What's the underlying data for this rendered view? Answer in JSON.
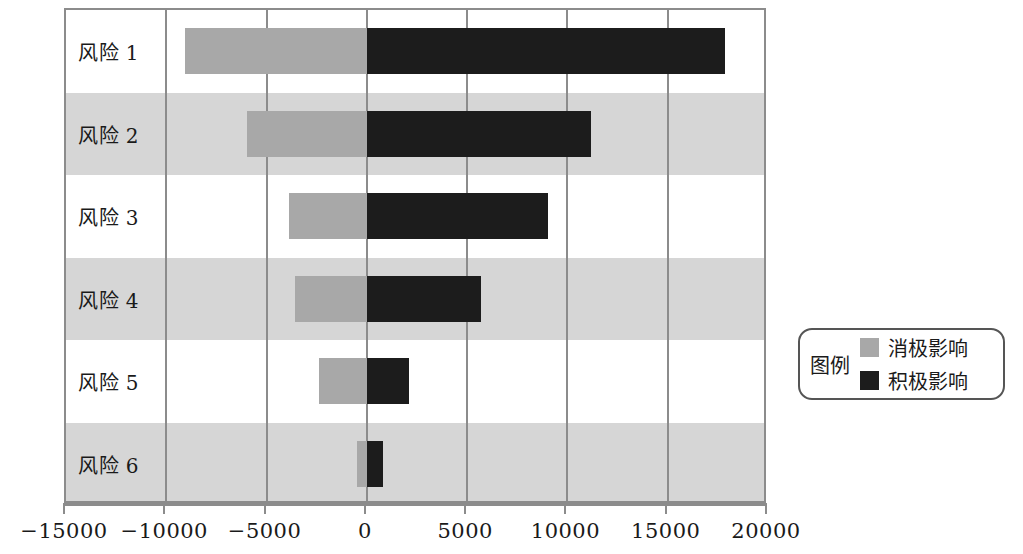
{
  "chart_data": {
    "type": "bar",
    "orientation": "horizontal",
    "subtype": "tornado",
    "title": "",
    "xlabel": "",
    "ylabel": "",
    "categories": [
      "风险 1",
      "风险 2",
      "风险 3",
      "风险 4",
      "风险 5",
      "风险 6"
    ],
    "series": [
      {
        "name": "消极影响",
        "color": "#a8a8a8",
        "values": [
          -9050,
          -6000,
          -3900,
          -3600,
          -2400,
          -500
        ]
      },
      {
        "name": "积极影响",
        "color": "#1c1c1c",
        "values": [
          17850,
          11200,
          9050,
          5700,
          2100,
          800
        ]
      }
    ],
    "xlim": [
      -15000,
      20000
    ],
    "xticks": [
      -15000,
      -10000,
      -5000,
      0,
      5000,
      10000,
      15000,
      20000
    ],
    "xtick_labels": [
      "−15000",
      "−10000",
      "−5000",
      "0",
      "5000",
      "10000",
      "15000",
      "20000"
    ],
    "grid": "vertical",
    "alternating_row_bands": true,
    "legend_position": "right"
  },
  "legend": {
    "title": "图例",
    "entries": [
      {
        "label": "消极影响",
        "color": "#a8a8a8"
      },
      {
        "label": "积极影响",
        "color": "#1c1c1c"
      }
    ]
  },
  "colors": {
    "negative": "#a8a8a8",
    "positive": "#1c1c1c",
    "band": "#d6d6d6",
    "frame": "#8c8c8c"
  }
}
